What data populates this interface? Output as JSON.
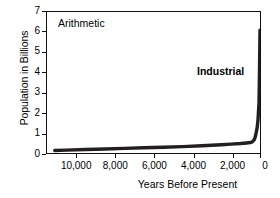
{
  "chart_data": {
    "type": "line",
    "title": "",
    "xlabel": "Years Before Present",
    "ylabel": "Population in Billions",
    "xlim": [
      11000,
      0
    ],
    "ylim": [
      0,
      7
    ],
    "x_reversed": true,
    "grid": false,
    "legend": "none",
    "xticks": [
      "10,000",
      "8,000",
      "6,000",
      "4,000",
      "2,000",
      "0"
    ],
    "xtick_values": [
      10000,
      8000,
      6000,
      4000,
      2000,
      0
    ],
    "yticks": [
      "0",
      "1",
      "2",
      "3",
      "4",
      "5",
      "6",
      "7"
    ],
    "ytick_values": [
      0,
      1,
      2,
      3,
      4,
      5,
      6,
      7
    ],
    "series": [
      {
        "name": "World Population",
        "color": "#231f20",
        "x": [
          10600,
          10000,
          9000,
          8000,
          7000,
          6000,
          5000,
          4000,
          3000,
          2500,
          2000,
          1500,
          1000,
          700,
          500,
          400,
          300,
          250,
          200,
          150,
          100,
          50,
          25,
          0
        ],
        "values": [
          0.12,
          0.14,
          0.17,
          0.2,
          0.23,
          0.26,
          0.29,
          0.32,
          0.36,
          0.38,
          0.41,
          0.44,
          0.47,
          0.5,
          0.52,
          0.55,
          0.65,
          0.78,
          1.0,
          1.25,
          1.65,
          2.5,
          4.1,
          6.1
        ]
      }
    ],
    "annotations": [
      {
        "text": "Arithmetic",
        "x": 10300,
        "y": 6.65,
        "bold": false
      },
      {
        "text": "Industrial",
        "x": 1700,
        "y": 4.45,
        "bold": true
      }
    ]
  },
  "axes": {
    "y_title": "Population in Billions",
    "x_title": "Years Before Present",
    "y_labels": [
      "7",
      "6",
      "5",
      "4",
      "3",
      "2",
      "1",
      "0"
    ],
    "x_labels": [
      "10,000",
      "8,000",
      "6,000",
      "4,000",
      "2,000",
      "0"
    ]
  },
  "annotations": {
    "scale_label": "Arithmetic",
    "era_label": "Industrial"
  },
  "colors": {
    "curve": "#231f20",
    "axis": "#111111",
    "background": "#ffffff",
    "text": "#000000"
  }
}
